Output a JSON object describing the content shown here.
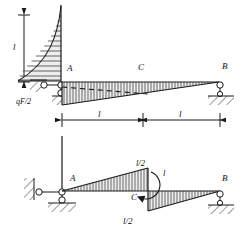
{
  "figure": {
    "type": "structural-bending-moment-diagram",
    "line_color": "#1a1a1a",
    "hatch_color": "#4a4a4a",
    "fill_color": "#e8e8e8"
  },
  "upper": {
    "vertical_dimension_label": "l",
    "load_label": "qF/2",
    "node_a": "A",
    "node_c": "C",
    "node_b": "B",
    "span_left_label": "l",
    "span_right_label": "l"
  },
  "lower": {
    "node_a": "A",
    "node_b": "B",
    "node_c": "C",
    "peak_label": "l/2",
    "moment_label": "l",
    "bottom_label": "l/2"
  }
}
